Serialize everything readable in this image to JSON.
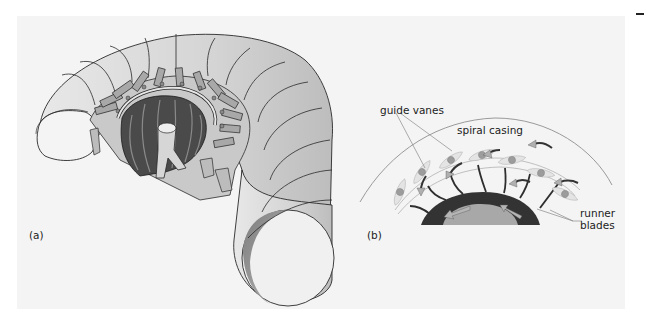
{
  "figure": {
    "panel_a": {
      "label": "(a)",
      "subject": "cutaway of Francis turbine with spiral casing, guide vanes and runner"
    },
    "panel_b": {
      "label": "(b)",
      "annotations": {
        "guide_vanes": "guide vanes",
        "spiral_casing": "spiral casing",
        "runner_blades_line1": "runner",
        "runner_blades_line2": "blades"
      }
    }
  },
  "colors": {
    "background": "#f4f4f4",
    "casing_fill": "#d8d8d8",
    "casing_dark": "#8c8c8c",
    "runner_dark": "#3a3a3a",
    "runner_hub": "#9a9a9a",
    "arrow_fill": "#b0b0b0",
    "vane_fill": "#e2e2e2",
    "outline": "#2a2a2a"
  }
}
